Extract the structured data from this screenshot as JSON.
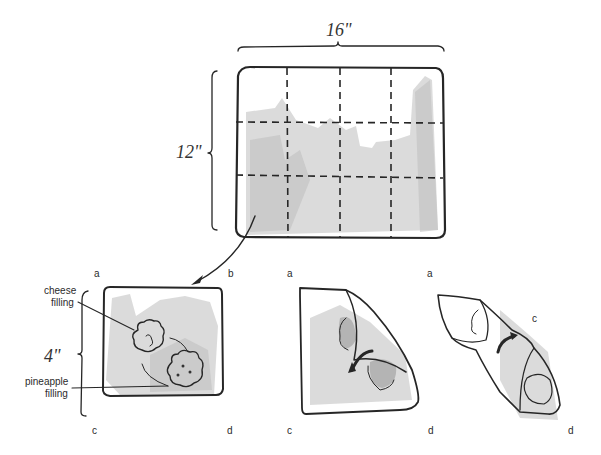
{
  "figure": {
    "colors": {
      "ink": "#262626",
      "wash_light": "#cfcfcf",
      "wash_dark": "#9a9a9a",
      "background": "#ffffff"
    }
  },
  "sheet": {
    "width_label": "16\"",
    "height_label": "12\"",
    "grid_columns": 4,
    "grid_rows": 3
  },
  "steps": [
    {
      "name": "square-with-fillings",
      "size_label": "4\"",
      "corners": {
        "top_left": "a",
        "top_right": "b",
        "bottom_left": "c",
        "bottom_right": "d"
      },
      "callouts": [
        {
          "line1": "cheese",
          "line2": "filling"
        },
        {
          "line1": "pineapple",
          "line2": "filling"
        }
      ]
    },
    {
      "name": "fold-corner-b",
      "corners": {
        "top_left": "a",
        "bottom_left": "c",
        "bottom_right": "d"
      }
    },
    {
      "name": "rolled-wrap",
      "corners": {
        "top": "a",
        "middle": "c",
        "bottom_right": "d"
      }
    }
  ]
}
